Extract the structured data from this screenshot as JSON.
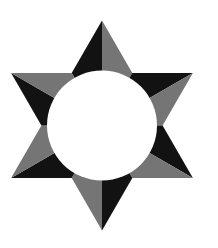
{
  "figure": {
    "canvas": {
      "width": 218,
      "height": 248
    },
    "background_color": "#ffffff",
    "star": {
      "center_x": 102,
      "center_y": 125.5,
      "outer_radius": 105,
      "inner_radius": 60.6,
      "point_names": [
        "top",
        "upper-right",
        "lower-right",
        "bottom",
        "lower-left",
        "upper-left"
      ],
      "point_angles_deg": [
        90,
        30,
        330,
        270,
        210,
        150
      ],
      "ccw_face_color": "#121212",
      "cw_face_color": "#757575"
    },
    "circle": {
      "radius": 55,
      "color": "#ffffff"
    }
  }
}
